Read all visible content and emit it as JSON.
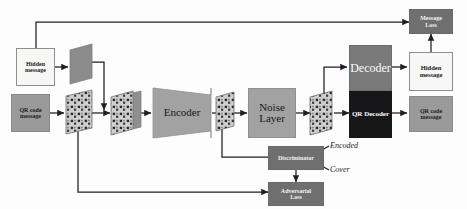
{
  "diagram": {
    "colors": {
      "light_box_fill": "#f7f7f5",
      "grey_box_fill": "#9a9a9a",
      "module_fill": "#a2a2a2",
      "loss_fill": "#6f6f6f",
      "decoder_fill": "#7a7a7a",
      "qr_decoder_fill": "#17171a",
      "line": "#1f1f1f"
    },
    "nodes": {
      "hidden_message_in": {
        "line1": "Hidden",
        "line2": "message"
      },
      "qr_code_message_in": {
        "line1": "QR code",
        "line2": "message"
      },
      "encoder": {
        "label": "Encoder"
      },
      "noise_layer": {
        "line1": "Noise",
        "line2": "Layer"
      },
      "decoder": {
        "label": "Decoder"
      },
      "qr_decoder": {
        "label": "QR Decoder"
      },
      "hidden_message_out": {
        "line1": "Hidden",
        "line2": "message"
      },
      "qr_code_message_out": {
        "line1": "QR code",
        "line2": "message"
      },
      "message_loss": {
        "line1": "Message",
        "line2": "Loss"
      },
      "discriminator": {
        "label": "Discriminator"
      },
      "adversarial_loss": {
        "line1": "Adversarial",
        "line2": "Loss"
      },
      "encoded_label": {
        "label": "Encoded"
      },
      "cover_label": {
        "label": "Cover"
      }
    },
    "tensors": [
      {
        "name": "hidden-message-tensor",
        "kind": "plain"
      },
      {
        "name": "cover-qr-tensor",
        "kind": "qr-grid"
      },
      {
        "name": "stacked-input-tensor",
        "kind": "qr-grid-stacked"
      },
      {
        "name": "encoded-image-tensor",
        "kind": "qr-grid"
      },
      {
        "name": "noised-image-tensor",
        "kind": "qr-grid"
      }
    ]
  }
}
